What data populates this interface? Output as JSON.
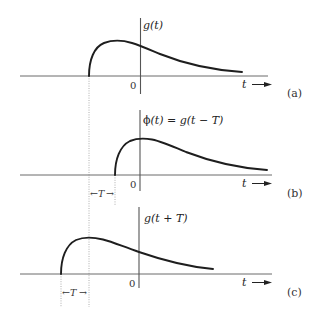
{
  "figure": {
    "panels": [
      {
        "id": "a",
        "function_label": "g(t)",
        "origin_label": "0",
        "axis_label": "t",
        "panel_tag": "(a)"
      },
      {
        "id": "b",
        "function_label": "ϕ(t) = g(t − T)",
        "origin_label": "0",
        "axis_label": "t",
        "panel_tag": "(b)",
        "shift_label": "T"
      },
      {
        "id": "c",
        "function_label": "g(t + T)",
        "origin_label": "0",
        "axis_label": "t",
        "panel_tag": "(c)",
        "shift_label": "T"
      }
    ],
    "colors": {
      "curve": "#1e1e1e",
      "axis": "#6b6b6b",
      "guide": "#9a9a9a"
    }
  }
}
